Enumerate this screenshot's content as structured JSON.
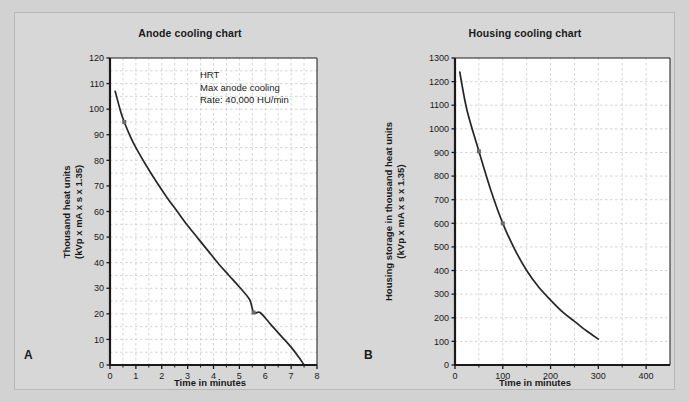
{
  "figure": {
    "background_color": "#d2d2d2",
    "card_color": "#d7d7d7",
    "plot_background": "#ffffff",
    "grid_color": "#c9c9c9",
    "axis_color": "#1a1a1a",
    "curve_color": "#262626",
    "marker_color": "#6b6b6b"
  },
  "panels": [
    {
      "letter": "A",
      "title": "Anode cooling chart"
    },
    {
      "letter": "B",
      "title": "Housing cooling chart"
    }
  ],
  "chart_data": [
    {
      "type": "line",
      "title": "Anode cooling chart",
      "panel": "A",
      "xlabel": "Time in minutes",
      "ylabel": "Thousand heat units\n(kVp x mA x s x 1.35)",
      "ylabel_line1": "Thousand heat units",
      "ylabel_line2": "(kVp x mA x s x 1.35)",
      "xlim": [
        0,
        8
      ],
      "ylim": [
        0,
        120
      ],
      "xticks": [
        0,
        1,
        2,
        3,
        4,
        5,
        6,
        7,
        8
      ],
      "xticklabels": [
        "0",
        "1",
        "2",
        "3",
        "4",
        "5",
        "6",
        "7",
        "8"
      ],
      "yticks": [
        0,
        10,
        20,
        30,
        40,
        50,
        60,
        70,
        80,
        90,
        100,
        110,
        120
      ],
      "yticklabels": [
        "0",
        "10",
        "20",
        "30",
        "40",
        "50",
        "60",
        "70",
        "80",
        "90",
        "100",
        "110",
        "120"
      ],
      "grid": true,
      "grid_style": "dashed",
      "legend": null,
      "annotations": [
        "HRT",
        "Max anode cooling",
        "Rate: 40,000 HU/min"
      ],
      "series": [
        {
          "name": "Anode cooling curve",
          "x": [
            0.2,
            0.4,
            0.55,
            0.8,
            1.0,
            1.4,
            1.8,
            2.2,
            2.6,
            3.0,
            3.4,
            3.8,
            4.2,
            4.6,
            5.0,
            5.4,
            5.55,
            5.8,
            6.2,
            6.6,
            7.0,
            7.3,
            7.5
          ],
          "y": [
            107,
            99.5,
            95,
            89,
            85,
            78,
            71.5,
            65.5,
            60,
            54.5,
            49.5,
            44.5,
            39.5,
            35,
            30.5,
            25.5,
            20.5,
            20.5,
            16,
            11.5,
            7,
            3,
            0
          ]
        }
      ],
      "markers": [
        {
          "x": 0.55,
          "y": 95
        },
        {
          "x": 5.55,
          "y": 20.5
        }
      ]
    },
    {
      "type": "line",
      "title": "Housing cooling chart",
      "panel": "B",
      "xlabel": "Time in minutes",
      "ylabel": "Housing storage in thousand heat units\n(kVp x mA x s x 1.35)",
      "ylabel_line1": "Housing storage in thousand heat units",
      "ylabel_line2": "(kVp x mA x s x 1.35)",
      "xlim": [
        0,
        450
      ],
      "ylim": [
        0,
        1300
      ],
      "xticks": [
        0,
        100,
        200,
        300,
        400
      ],
      "xticklabels": [
        "0",
        "100",
        "200",
        "300",
        "400"
      ],
      "yticks": [
        0,
        100,
        200,
        300,
        400,
        500,
        600,
        700,
        800,
        900,
        1000,
        1100,
        1200,
        1300
      ],
      "yticklabels": [
        "0",
        "100",
        "200",
        "300",
        "400",
        "500",
        "600",
        "700",
        "800",
        "900",
        "1000",
        "1100",
        "1200",
        "1300"
      ],
      "grid": true,
      "grid_style": "dashed",
      "legend": null,
      "annotations": [],
      "series": [
        {
          "name": "Housing cooling curve",
          "x": [
            10,
            25,
            50,
            75,
            100,
            125,
            150,
            175,
            200,
            225,
            250,
            275,
            300
          ],
          "y": [
            1240,
            1080,
            905,
            740,
            600,
            490,
            400,
            330,
            275,
            225,
            185,
            145,
            110
          ]
        }
      ],
      "markers": [
        {
          "x": 50,
          "y": 905
        },
        {
          "x": 100,
          "y": 600
        }
      ]
    }
  ]
}
